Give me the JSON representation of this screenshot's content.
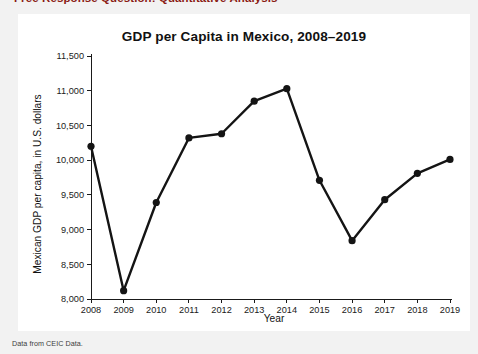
{
  "page": {
    "header_title": "Free Response Question: Quantitative Analysis",
    "header_color": "#8a1a12",
    "background_color": "#f2f2f2",
    "card_background": "#ffffff",
    "source_caption": "Data from CEIC Data."
  },
  "chart_data": {
    "type": "line",
    "title": "GDP per Capita in Mexico, 2008–2019",
    "xlabel": "Year",
    "ylabel": "Mexican GDP per capita, in U.S. dollars",
    "categories": [
      "2008",
      "2009",
      "2010",
      "2011",
      "2012",
      "2013",
      "2014",
      "2015",
      "2016",
      "2017",
      "2018",
      "2019"
    ],
    "values": [
      10200,
      8120,
      9390,
      10320,
      10380,
      10850,
      11030,
      9710,
      8840,
      9430,
      9810,
      10010
    ],
    "series": [
      {
        "name": "Mexican GDP per capita",
        "values": [
          10200,
          8120,
          9390,
          10320,
          10380,
          10850,
          11030,
          9710,
          8840,
          9430,
          9810,
          10010
        ]
      }
    ],
    "ylim": [
      8000,
      11500
    ],
    "ytick_values": [
      8000,
      8500,
      9000,
      9500,
      10000,
      10500,
      11000,
      11500
    ],
    "ytick_labels": [
      "8,000",
      "8,500",
      "9,000",
      "9,500",
      "10,000",
      "10,500",
      "11,000",
      "11,500"
    ],
    "xtick_labels": [
      "2008",
      "2009",
      "2010",
      "2011",
      "2012",
      "2013",
      "2014",
      "2015",
      "2016",
      "2017",
      "2018",
      "2019"
    ],
    "grid": false,
    "legend": false,
    "legend_position": "none",
    "line_color": "#141414",
    "marker_color": "#141414",
    "marker_shape": "circle"
  }
}
